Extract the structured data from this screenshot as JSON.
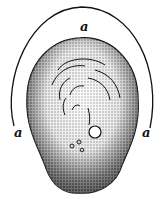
{
  "figure": {
    "labels": [
      {
        "id": "top",
        "text": "a"
      },
      {
        "id": "left",
        "text": "a"
      },
      {
        "id": "right",
        "text": "a"
      }
    ],
    "colors": {
      "ink": "#111111",
      "paper": "#ffffff"
    }
  }
}
